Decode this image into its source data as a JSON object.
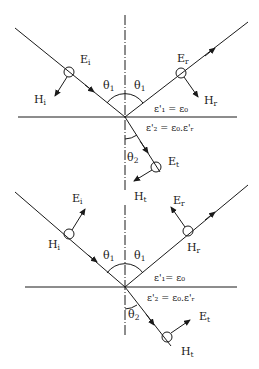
{
  "figure": {
    "colors": {
      "ink": "#1a1a1a",
      "background": "#ffffff"
    },
    "panels": [
      {
        "id": "top",
        "polarization": "E perpendicular to plane of incidence (E into page)",
        "labels": {
          "incident_E": "E",
          "incident_E_sub": "i",
          "incident_H": "H",
          "incident_H_sub": "i",
          "reflected_E": "E",
          "reflected_E_sub": "r",
          "reflected_H": "H",
          "reflected_H_sub": "r",
          "transmitted_E": "E",
          "transmitted_E_sub": "t",
          "transmitted_H": "H",
          "transmitted_H_sub": "t",
          "theta_incident": "θ",
          "theta_incident_sub": "1",
          "theta_reflected": "θ",
          "theta_reflected_sub": "1",
          "theta_transmitted": "θ",
          "theta_transmitted_sub": "2",
          "medium1": "ε'₁ = ε₀",
          "medium2": "ε'₂ = ε₀.ε'ᵣ"
        }
      },
      {
        "id": "bottom",
        "polarization": "H perpendicular to plane of incidence (H into page)",
        "labels": {
          "incident_E": "E",
          "incident_E_sub": "i",
          "incident_H": "H",
          "incident_H_sub": "i",
          "reflected_E": "E",
          "reflected_E_sub": "r",
          "reflected_H": "H",
          "reflected_H_sub": "r",
          "transmitted_E": "E",
          "transmitted_E_sub": "t",
          "transmitted_H": "H",
          "transmitted_H_sub": "t",
          "theta_incident": "θ",
          "theta_incident_sub": "1",
          "theta_reflected": "θ",
          "theta_reflected_sub": "1",
          "theta_transmitted": "θ",
          "theta_transmitted_sub": "2",
          "medium1": "ε'₁= ε₀",
          "medium2": "ε'₂ = ε₀.ε'ᵣ"
        }
      }
    ]
  }
}
